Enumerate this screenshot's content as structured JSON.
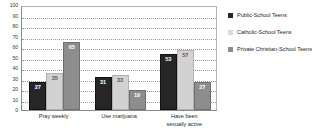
{
  "chart_data": {
    "type": "bar",
    "title": "",
    "xlabel": "",
    "ylabel": "",
    "ylim": [
      0,
      100
    ],
    "yticks": [
      0,
      10,
      20,
      30,
      40,
      50,
      60,
      70,
      80,
      90,
      100
    ],
    "grid": true,
    "legend_position": "right",
    "categories": [
      "Pray weekly",
      "Use marijuana",
      "Have been sexually active"
    ],
    "series": [
      {
        "name": "Public-School Teens",
        "color": "#262626",
        "values": [
          27,
          31,
          53
        ]
      },
      {
        "name": "Catholic-School Teens",
        "color": "#d2d2d2",
        "values": [
          35,
          33,
          57
        ]
      },
      {
        "name": "Private Christian-School Teens",
        "color": "#8d8d8d",
        "values": [
          65,
          19,
          27
        ]
      }
    ]
  },
  "axis": {
    "y_tick_labels": [
      "0",
      "10",
      "20",
      "30",
      "40",
      "50",
      "60",
      "70",
      "80",
      "90",
      "100"
    ]
  },
  "categories_display": [
    {
      "line1": "Pray weekly",
      "line2": ""
    },
    {
      "line1": "Use marijuana",
      "line2": ""
    },
    {
      "line1": "Have been",
      "line2": "sexually active"
    }
  ],
  "legend": {
    "items": [
      {
        "label": "Public-School Teens",
        "swatch": "legend-swatch-public"
      },
      {
        "label": "Catholic-School Teens",
        "swatch": "legend-swatch-catholic"
      },
      {
        "label": "Private Christian-School Teens",
        "swatch": "legend-swatch-private"
      }
    ]
  },
  "bar_labels": {
    "g0s0": "27",
    "g0s1": "35",
    "g0s2": "65",
    "g1s0": "31",
    "g1s1": "33",
    "g1s2": "19",
    "g2s0": "53",
    "g2s1": "57",
    "g2s2": "27"
  }
}
